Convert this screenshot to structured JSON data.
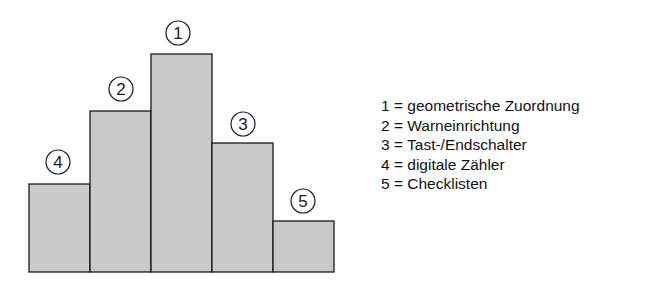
{
  "chart_data": {
    "type": "bar",
    "title": "",
    "xlabel": "",
    "ylabel": "",
    "grid": false,
    "legend_position": "right",
    "categories": [
      "4",
      "2",
      "1",
      "3",
      "5"
    ],
    "values": [
      88,
      161,
      218,
      129,
      51
    ],
    "bar_order_left_to_right": [
      "4",
      "2",
      "1",
      "3",
      "5"
    ],
    "annotations": [
      "1",
      "2",
      "3",
      "4",
      "5"
    ],
    "legend": [
      "1 = geometrische Zuordnung",
      "2 = Warneinrichtung",
      "3 = Tast-/Endschalter",
      "4 = digitale Zähler",
      "5 = Checklisten"
    ]
  },
  "bars": [
    {
      "label": "4",
      "x": 29,
      "top": 184
    },
    {
      "label": "2",
      "x": 90,
      "top": 111
    },
    {
      "label": "1",
      "x": 151,
      "top": 54
    },
    {
      "label": "3",
      "x": 212,
      "top": 143
    },
    {
      "label": "5",
      "x": 273,
      "top": 221
    }
  ],
  "markers": [
    {
      "label": "1",
      "cx": 178,
      "cy": 33
    },
    {
      "label": "2",
      "cx": 121,
      "cy": 89
    },
    {
      "label": "3",
      "cx": 243,
      "cy": 124
    },
    {
      "label": "4",
      "cx": 58,
      "cy": 162
    },
    {
      "label": "5",
      "cx": 303,
      "cy": 201
    }
  ],
  "legend": [
    "1 = geometrische Zuordnung",
    "2 = Warneinrichtung",
    "3 = Tast-/Endschalter",
    "4 = digitale Zähler",
    "5 = Checklisten"
  ]
}
